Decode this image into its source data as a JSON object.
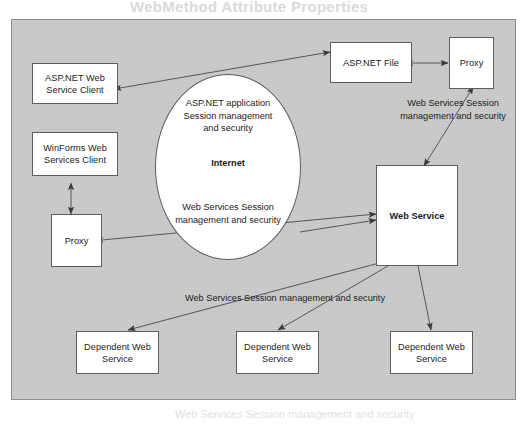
{
  "figure": {
    "type": "architecture-diagram",
    "background_color": "#ffffff",
    "panel_color": "#c9c9c9",
    "node_fill": "#ffffff",
    "stroke_color": "#5d5d5d",
    "ghost_text": "WebMethod Attribute Properties",
    "bottom_ghost_text": "Web Services Session management and security"
  },
  "nodes": {
    "aspnet_web_service_client": {
      "label": "ASP.NET Web\nService Client"
    },
    "winforms_web_services_client": {
      "label": "WinForms Web\nServices Client"
    },
    "proxy_left": {
      "label": "Proxy"
    },
    "aspnet_file": {
      "label": "ASP.NET File"
    },
    "proxy_right": {
      "label": "Proxy"
    },
    "web_service": {
      "label": "Web Service"
    },
    "dependent_web_service_1": {
      "label": "Dependent Web\nService"
    },
    "dependent_web_service_2": {
      "label": "Dependent Web\nService"
    },
    "dependent_web_service_3": {
      "label": "Dependent Web\nService"
    }
  },
  "internet_cloud": {
    "top_label": "ASP.NET application\nSession management\nand security",
    "center_label": "Internet",
    "bottom_label": "Web Services Session\nmanagement and security"
  },
  "edge_labels": {
    "right_top": "Web Services Session\nmanagement and security",
    "bottom": "Web Services Session management and security"
  }
}
